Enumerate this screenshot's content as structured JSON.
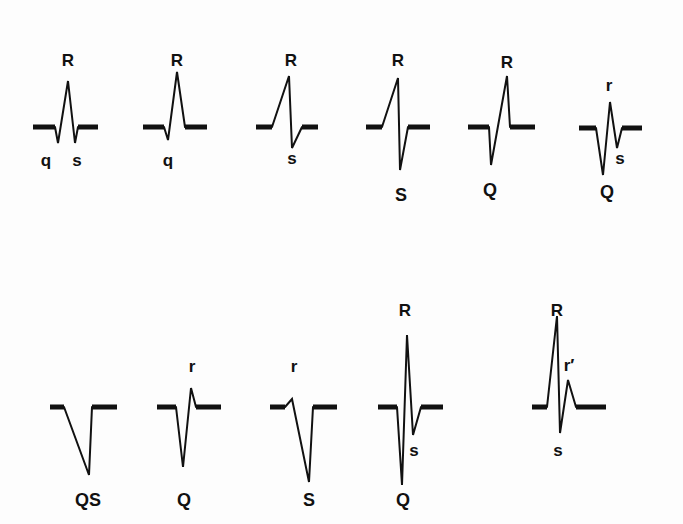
{
  "diagram": {
    "rows": [
      {
        "complexes": [
          {
            "id": "qRs",
            "labels": [
              {
                "text": "R",
                "x": 68,
                "y": 60
              },
              {
                "text": "q",
                "x": 46,
                "y": 160
              },
              {
                "text": "s",
                "x": 77,
                "y": 160
              }
            ]
          },
          {
            "id": "qR",
            "labels": [
              {
                "text": "R",
                "x": 177,
                "y": 60
              },
              {
                "text": "q",
                "x": 168,
                "y": 160
              }
            ]
          },
          {
            "id": "Rs",
            "labels": [
              {
                "text": "R",
                "x": 291,
                "y": 60
              },
              {
                "text": "s",
                "x": 292,
                "y": 158
              }
            ]
          },
          {
            "id": "RS",
            "labels": [
              {
                "text": "R",
                "x": 398,
                "y": 60
              },
              {
                "text": "S",
                "x": 401,
                "y": 195
              }
            ]
          },
          {
            "id": "QR",
            "labels": [
              {
                "text": "R",
                "x": 507,
                "y": 62
              },
              {
                "text": "Q",
                "x": 490,
                "y": 190
              }
            ]
          },
          {
            "id": "QrS",
            "labels": [
              {
                "text": "r",
                "x": 609,
                "y": 85
              },
              {
                "text": "s",
                "x": 620,
                "y": 158
              },
              {
                "text": "Q",
                "x": 607,
                "y": 192
              }
            ]
          }
        ]
      },
      {
        "complexes": [
          {
            "id": "QS",
            "labels": [
              {
                "text": "QS",
                "x": 88,
                "y": 500
              }
            ]
          },
          {
            "id": "Qr",
            "labels": [
              {
                "text": "r",
                "x": 192,
                "y": 366
              },
              {
                "text": "Q",
                "x": 184,
                "y": 500
              }
            ]
          },
          {
            "id": "rS",
            "labels": [
              {
                "text": "r",
                "x": 294,
                "y": 366
              },
              {
                "text": "S",
                "x": 309,
                "y": 500
              }
            ]
          },
          {
            "id": "QRs",
            "labels": [
              {
                "text": "R",
                "x": 405,
                "y": 310
              },
              {
                "text": "s",
                "x": 414,
                "y": 450
              },
              {
                "text": "Q",
                "x": 403,
                "y": 500
              }
            ]
          },
          {
            "id": "RSr'",
            "labels": [
              {
                "text": "R",
                "x": 557,
                "y": 310
              },
              {
                "text": "r′",
                "x": 569,
                "y": 365
              },
              {
                "text": "s",
                "x": 558,
                "y": 450
              }
            ]
          }
        ]
      }
    ]
  },
  "colors": {
    "ink": "#111111",
    "background": "#fdfdfd"
  }
}
